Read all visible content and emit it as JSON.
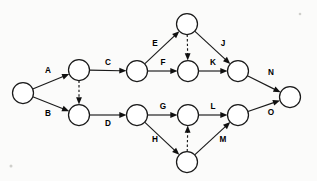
{
  "diagram": {
    "type": "pert-activity-on-arrow-network",
    "colors": {
      "background": "#fbfbfa",
      "stroke": "#1a1a1a",
      "node_fill": "#ffffff",
      "label": "#000000"
    },
    "node_radius": 10.5,
    "nodes": [
      {
        "id": "n1",
        "name": "start-node",
        "cx": 23,
        "cy": 93
      },
      {
        "id": "n2",
        "name": "upper-left-node",
        "cx": 79,
        "cy": 70
      },
      {
        "id": "n3",
        "name": "lower-left-node",
        "cx": 79,
        "cy": 115
      },
      {
        "id": "n4",
        "name": "upper-mid-node",
        "cx": 137,
        "cy": 71
      },
      {
        "id": "n5",
        "name": "upper-apex-node",
        "cx": 187,
        "cy": 24
      },
      {
        "id": "n6",
        "name": "upper-center-node",
        "cx": 188,
        "cy": 71
      },
      {
        "id": "n7",
        "name": "upper-right-node",
        "cx": 238,
        "cy": 71
      },
      {
        "id": "n8",
        "name": "lower-mid-node",
        "cx": 137,
        "cy": 115
      },
      {
        "id": "n9",
        "name": "lower-apex-node",
        "cx": 187,
        "cy": 162
      },
      {
        "id": "n10",
        "name": "lower-center-node",
        "cx": 188,
        "cy": 115
      },
      {
        "id": "n11",
        "name": "lower-right-node",
        "cx": 238,
        "cy": 115
      },
      {
        "id": "n12",
        "name": "end-node",
        "cx": 290,
        "cy": 97
      }
    ],
    "edges": [
      {
        "id": "e-A",
        "label": "A",
        "from": "n1",
        "to": "n2",
        "style": "solid",
        "label_x": 48,
        "label_y": 71,
        "name": "edge-a"
      },
      {
        "id": "e-B",
        "label": "B",
        "from": "n1",
        "to": "n3",
        "style": "solid",
        "label_x": 48,
        "label_y": 114,
        "name": "edge-b"
      },
      {
        "id": "e-d1",
        "label": "",
        "from": "n2",
        "to": "n3",
        "style": "dashed",
        "label_x": 0,
        "label_y": 0,
        "name": "edge-dummy-upper-left"
      },
      {
        "id": "e-C",
        "label": "C",
        "from": "n2",
        "to": "n4",
        "style": "solid",
        "label_x": 108,
        "label_y": 63,
        "name": "edge-c"
      },
      {
        "id": "e-D",
        "label": "D",
        "from": "n3",
        "to": "n8",
        "style": "solid",
        "label_x": 108,
        "label_y": 124,
        "name": "edge-d"
      },
      {
        "id": "e-E",
        "label": "E",
        "from": "n4",
        "to": "n5",
        "style": "solid",
        "label_x": 155,
        "label_y": 44,
        "name": "edge-e"
      },
      {
        "id": "e-F",
        "label": "F",
        "from": "n4",
        "to": "n6",
        "style": "solid",
        "label_x": 163,
        "label_y": 63,
        "name": "edge-f"
      },
      {
        "id": "e-d2",
        "label": "",
        "from": "n5",
        "to": "n6",
        "style": "dashed",
        "label_x": 0,
        "label_y": 0,
        "name": "edge-dummy-upper"
      },
      {
        "id": "e-J",
        "label": "J",
        "from": "n5",
        "to": "n7",
        "style": "solid",
        "label_x": 223,
        "label_y": 44,
        "name": "edge-j"
      },
      {
        "id": "e-K",
        "label": "K",
        "from": "n6",
        "to": "n7",
        "style": "solid",
        "label_x": 213,
        "label_y": 63,
        "name": "edge-k"
      },
      {
        "id": "e-N",
        "label": "N",
        "from": "n7",
        "to": "n12",
        "style": "solid",
        "label_x": 271,
        "label_y": 73,
        "name": "edge-n"
      },
      {
        "id": "e-G",
        "label": "G",
        "from": "n8",
        "to": "n10",
        "style": "solid",
        "label_x": 163,
        "label_y": 107,
        "name": "edge-g"
      },
      {
        "id": "e-H",
        "label": "H",
        "from": "n8",
        "to": "n9",
        "style": "solid",
        "label_x": 155,
        "label_y": 140,
        "name": "edge-h"
      },
      {
        "id": "e-d3",
        "label": "",
        "from": "n9",
        "to": "n10",
        "style": "dashed",
        "label_x": 0,
        "label_y": 0,
        "name": "edge-dummy-lower"
      },
      {
        "id": "e-M",
        "label": "M",
        "from": "n9",
        "to": "n11",
        "style": "solid",
        "label_x": 223,
        "label_y": 140,
        "name": "edge-m"
      },
      {
        "id": "e-L",
        "label": "L",
        "from": "n10",
        "to": "n11",
        "style": "solid",
        "label_x": 213,
        "label_y": 107,
        "name": "edge-l"
      },
      {
        "id": "e-O",
        "label": "O",
        "from": "n11",
        "to": "n12",
        "style": "solid",
        "label_x": 271,
        "label_y": 113,
        "name": "edge-o"
      }
    ]
  }
}
